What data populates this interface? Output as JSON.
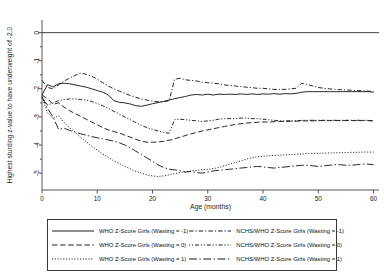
{
  "chart_data": {
    "type": "line",
    "title": "",
    "xlabel": "Age (months)",
    "ylabel": "Highest stunting z-value to have underweight of -2.0",
    "xlim": [
      0,
      61
    ],
    "ylim": [
      -5.6,
      0.45
    ],
    "xticks": [
      "0",
      "10",
      "20",
      "30",
      "40",
      "50",
      "60"
    ],
    "xtick_values": [
      0,
      10,
      20,
      30,
      40,
      50,
      60
    ],
    "yticks": [
      "0",
      "-1",
      "-2",
      "-3",
      "-4",
      "-5"
    ],
    "ytick_values": [
      0,
      -1,
      -2,
      -3,
      -4,
      -5
    ],
    "grid": false,
    "reference_line_y": 0,
    "legend_position": "below-plot",
    "x": [
      0,
      1,
      2,
      3,
      4,
      5,
      6,
      7,
      8,
      9,
      10,
      11,
      12,
      13,
      14,
      15,
      16,
      17,
      18,
      19,
      20,
      21,
      22,
      23,
      24,
      25,
      26,
      27,
      28,
      29,
      30,
      31,
      32,
      33,
      34,
      35,
      36,
      37,
      38,
      39,
      40,
      41,
      42,
      43,
      44,
      45,
      46,
      47,
      48,
      49,
      50,
      51,
      52,
      53,
      54,
      55,
      56,
      57,
      58,
      59,
      60
    ],
    "series": [
      {
        "name": "WHO Z-Score Girls (Wasting = -1)",
        "style": "solid",
        "values": [
          -2.22,
          -1.85,
          -1.93,
          -1.82,
          -1.8,
          -1.82,
          -1.86,
          -1.9,
          -1.94,
          -2.0,
          -2.06,
          -2.12,
          -2.22,
          -2.42,
          -2.48,
          -2.5,
          -2.54,
          -2.6,
          -2.62,
          -2.58,
          -2.53,
          -2.49,
          -2.45,
          -2.4,
          -2.35,
          -2.31,
          -2.27,
          -2.22,
          -2.2,
          -2.22,
          -2.19,
          -2.22,
          -2.19,
          -2.2,
          -2.19,
          -2.2,
          -2.18,
          -2.2,
          -2.18,
          -2.2,
          -2.18,
          -2.19,
          -2.17,
          -2.19,
          -2.17,
          -2.18,
          -2.16,
          -2.12,
          -2.1,
          -2.1,
          -2.1,
          -2.1,
          -2.1,
          -2.1,
          -2.1,
          -2.1,
          -2.1,
          -2.1,
          -2.1,
          -2.1,
          -2.12
        ]
      },
      {
        "name": "WHO Z-Score Girls (Wasting = 0)",
        "style": "dashed",
        "values": [
          -2.22,
          -2.35,
          -2.55,
          -2.5,
          -2.65,
          -2.78,
          -2.88,
          -2.98,
          -3.08,
          -3.18,
          -3.28,
          -3.38,
          -3.46,
          -3.52,
          -3.57,
          -3.65,
          -3.72,
          -3.8,
          -3.86,
          -3.9,
          -3.9,
          -3.89,
          -3.87,
          -3.83,
          -3.78,
          -3.72,
          -3.66,
          -3.6,
          -3.55,
          -3.5,
          -3.46,
          -3.42,
          -3.38,
          -3.34,
          -3.3,
          -3.27,
          -3.24,
          -3.22,
          -3.2,
          -3.19,
          -3.18,
          -3.18,
          -3.17,
          -3.16,
          -3.16,
          -3.15,
          -3.15,
          -3.14,
          -3.14,
          -3.14,
          -3.13,
          -3.13,
          -3.13,
          -3.13,
          -3.13,
          -3.13,
          -3.13,
          -3.13,
          -3.13,
          -3.13,
          -3.14
        ]
      },
      {
        "name": "WHO Z-Score Girls (Wasting = 1)",
        "style": "dotted",
        "values": [
          -2.28,
          -2.85,
          -3.05,
          -2.96,
          -3.2,
          -3.38,
          -3.55,
          -3.72,
          -3.88,
          -4.04,
          -4.18,
          -4.32,
          -4.44,
          -4.56,
          -4.66,
          -4.76,
          -4.85,
          -4.94,
          -5.0,
          -5.06,
          -5.1,
          -5.12,
          -5.1,
          -5.06,
          -5.02,
          -4.98,
          -4.95,
          -4.92,
          -4.9,
          -4.88,
          -4.86,
          -4.84,
          -4.8,
          -4.74,
          -4.68,
          -4.62,
          -4.56,
          -4.5,
          -4.45,
          -4.42,
          -4.4,
          -4.38,
          -4.37,
          -4.36,
          -4.35,
          -4.34,
          -4.33,
          -4.32,
          -4.3,
          -4.3,
          -4.29,
          -4.29,
          -4.28,
          -4.28,
          -4.27,
          -4.27,
          -4.26,
          -4.26,
          -4.25,
          -4.25,
          -4.25
        ]
      },
      {
        "name": "NCHS/WHO Z-Score Girls (Wasting = -1)",
        "style": "dashdot",
        "values": [
          -1.7,
          -1.95,
          -2.0,
          -1.86,
          -1.72,
          -1.62,
          -1.52,
          -1.44,
          -1.48,
          -1.55,
          -1.66,
          -1.78,
          -1.9,
          -2.0,
          -2.08,
          -2.16,
          -2.24,
          -2.3,
          -2.36,
          -2.4,
          -2.44,
          -2.46,
          -2.45,
          -2.43,
          -1.66,
          -1.62,
          -1.68,
          -1.7,
          -1.72,
          -1.76,
          -1.78,
          -1.8,
          -1.82,
          -1.86,
          -1.88,
          -1.9,
          -1.92,
          -1.94,
          -1.96,
          -1.98,
          -1.98,
          -2.0,
          -2.02,
          -2.02,
          -2.02,
          -2.0,
          -1.98,
          -1.8,
          -1.84,
          -1.9,
          -1.95,
          -1.98,
          -2.0,
          -2.02,
          -2.03,
          -2.04,
          -2.05,
          -2.06,
          -2.07,
          -2.08,
          -2.1
        ]
      },
      {
        "name": "NCHS/WHO Z-Score Girls (Wasting = 0)",
        "style": "dashdotdot",
        "values": [
          -2.3,
          -2.58,
          -2.5,
          -2.42,
          -2.38,
          -2.36,
          -2.36,
          -2.38,
          -2.4,
          -2.45,
          -2.52,
          -2.6,
          -2.7,
          -2.8,
          -2.9,
          -3.0,
          -3.1,
          -3.2,
          -3.3,
          -3.38,
          -3.44,
          -3.5,
          -3.55,
          -3.58,
          -3.1,
          -3.08,
          -3.1,
          -3.12,
          -3.14,
          -3.16,
          -3.14,
          -3.12,
          -3.08,
          -3.06,
          -3.06,
          -3.06,
          -3.04,
          -3.04,
          -3.06,
          -3.06,
          -3.08,
          -3.1,
          -3.12,
          -3.14,
          -3.14,
          -3.14,
          -3.14,
          -3.12,
          -3.12,
          -3.12,
          -3.12,
          -3.12,
          -3.12,
          -3.12,
          -3.12,
          -3.12,
          -3.12,
          -3.12,
          -3.12,
          -3.12,
          -3.14
        ]
      },
      {
        "name": "NCHS/WHO Z-Score Girls (Wasting = 1)",
        "style": "longdashdot",
        "values": [
          -2.28,
          -2.7,
          -3.0,
          -3.44,
          -3.4,
          -3.48,
          -3.54,
          -3.6,
          -3.65,
          -3.7,
          -3.74,
          -3.78,
          -3.82,
          -3.86,
          -3.92,
          -4.0,
          -4.1,
          -4.22,
          -4.34,
          -4.46,
          -4.58,
          -4.7,
          -4.8,
          -4.86,
          -4.88,
          -4.92,
          -4.96,
          -4.94,
          -4.98,
          -5.0,
          -4.96,
          -4.92,
          -4.9,
          -4.88,
          -4.86,
          -4.84,
          -4.82,
          -4.8,
          -4.78,
          -4.76,
          -4.78,
          -4.8,
          -4.82,
          -4.8,
          -4.78,
          -4.76,
          -4.74,
          -4.72,
          -4.72,
          -4.74,
          -4.76,
          -4.74,
          -4.72,
          -4.7,
          -4.7,
          -4.72,
          -4.72,
          -4.7,
          -4.68,
          -4.68,
          -4.7
        ]
      }
    ]
  },
  "legend": {
    "items": [
      {
        "label": "WHO Z-Score Girls (Wasting = -1)",
        "style": "solid"
      },
      {
        "label": "NCHS/WHO Z-Score Girls (Wasting = -1)",
        "style": "dashdot"
      },
      {
        "label": "WHO Z-Score Girls (Wasting = 0)",
        "style": "dashed"
      },
      {
        "label": "NCHS/WHO Z-Score Girls (Wasting = 0)",
        "style": "dashdotdot"
      },
      {
        "label": "WHO Z-Score Girls (Wasting = 1)",
        "style": "dotted"
      },
      {
        "label": "NCHS/WHO Z-Score Girls (Wasting = 1)",
        "style": "longdashdot"
      }
    ]
  },
  "colors": {
    "ink": "#1c1c1c",
    "axis": "#2b2b2b",
    "background": "#ffffff",
    "legend_border": "#3a3a3a"
  }
}
